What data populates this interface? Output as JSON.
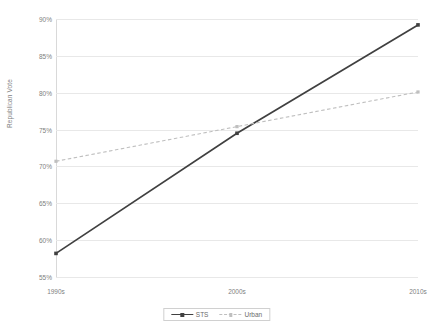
{
  "chart_data": {
    "type": "line",
    "title": "",
    "xlabel": "",
    "ylabel": "Republican Vote",
    "categories": [
      "1990s",
      "2000s",
      "2010s"
    ],
    "ylim": [
      55,
      90
    ],
    "ytick_labels": [
      "55%",
      "60%",
      "65%",
      "70%",
      "75%",
      "80%",
      "85%",
      "90%"
    ],
    "ytick_values": [
      55,
      60,
      65,
      70,
      75,
      80,
      85,
      90
    ],
    "grid": true,
    "legend_position": "bottom",
    "series": [
      {
        "name": "STS",
        "values": [
          58.2,
          74.5,
          89.2
        ],
        "color": "#404040",
        "style": "solid"
      },
      {
        "name": "Urban",
        "values": [
          70.7,
          75.4,
          80.1
        ],
        "color": "#bfbfbf",
        "style": "dashed"
      }
    ]
  },
  "legend": {
    "items": [
      {
        "label": "STS"
      },
      {
        "label": "Urban"
      }
    ]
  },
  "colors": {
    "sts": "#404040",
    "urban": "#bfbfbf",
    "gridline": "#e8e8e8",
    "axis": "#d9d9d9",
    "text": "#808080"
  }
}
